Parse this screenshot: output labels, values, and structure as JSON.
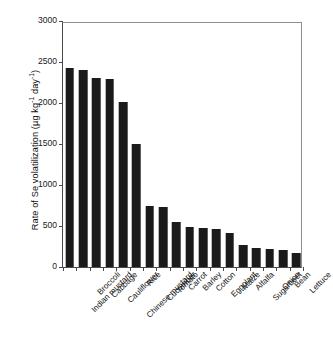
{
  "chart_data": {
    "type": "bar",
    "title": "",
    "xlabel": "",
    "ylabel_plain": "Rate of Se volatilization (µg kg-1 day-1)",
    "ylabel_parts": {
      "prefix": "Rate of Se volatilization (µg kg",
      "sup1": "-1",
      "middle": " day",
      "sup2": "-1",
      "suffix": ")"
    },
    "categories": [
      "Indian mustard",
      "Broccoli",
      "Cabbage",
      "Cauliflower",
      "Chinese mustard",
      "Rice",
      "Cucumber",
      "Tomato",
      "Carrot",
      "Barley",
      "Cotton",
      "Eggplant",
      "Maize",
      "Alfalfa",
      "Sugarbeet",
      "Onion",
      "Bean",
      "Lettuce"
    ],
    "values": [
      2430,
      2400,
      2310,
      2290,
      2015,
      1500,
      750,
      735,
      550,
      490,
      480,
      465,
      415,
      270,
      235,
      215,
      205,
      170
    ],
    "ylim": [
      0,
      3000
    ],
    "yticks": [
      0,
      500,
      1000,
      1500,
      2000,
      2500,
      3000
    ],
    "ytick_labels": [
      "0",
      "500",
      "1000",
      "1500",
      "2000",
      "2500",
      "3000"
    ],
    "grid": false,
    "legend": null,
    "bar_color": "#1b1b1b",
    "axis_color": "#4a4a4a"
  }
}
